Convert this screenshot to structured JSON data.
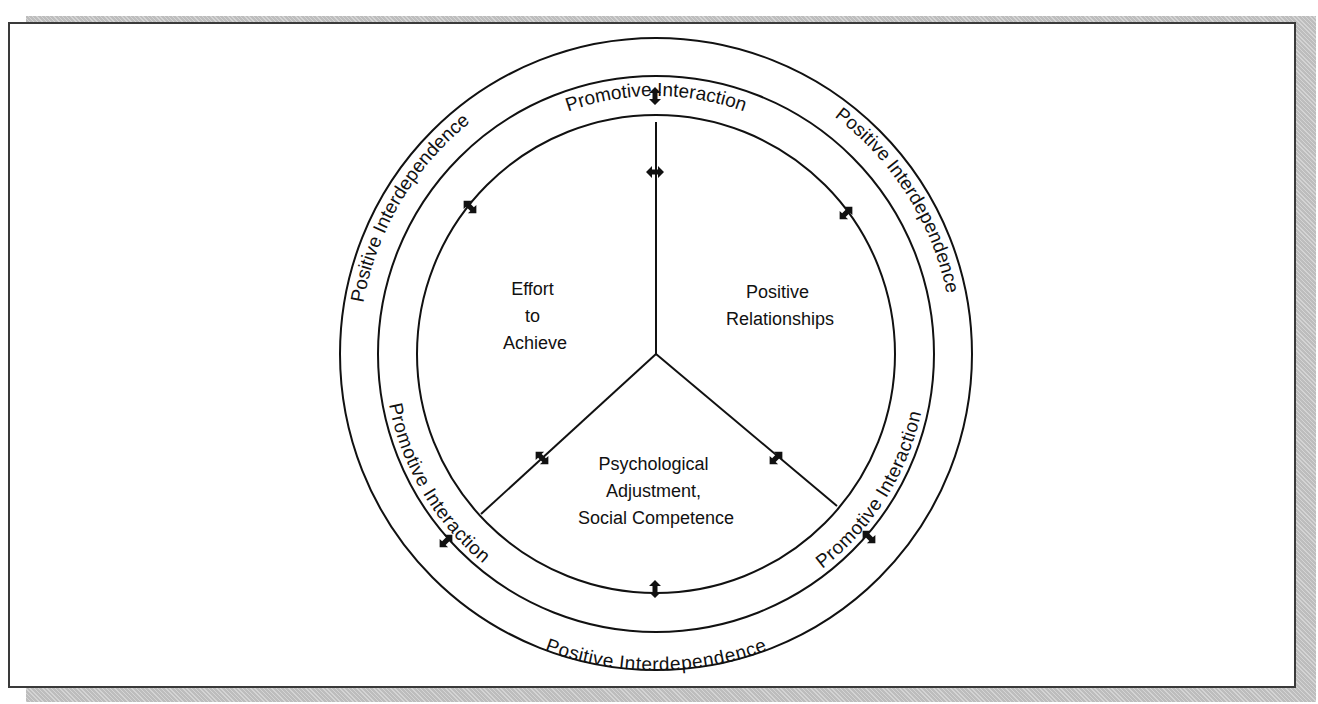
{
  "diagram": {
    "colors": {
      "stroke": "#111111",
      "background": "#ffffff",
      "shadow": "#bdbdbd",
      "frame": "#3a3a3a"
    },
    "outer_ring_labels": {
      "top_left": "Positive Interdependence",
      "top_right": "Positive Interdependence",
      "bottom": "Positive Interdependence"
    },
    "middle_ring_labels": {
      "top": "Promotive Interaction",
      "bottom_left": "Promotive Interaction",
      "bottom_right": "Promotive Interaction"
    },
    "sectors": {
      "left": {
        "line1": "Effort",
        "line2": "to",
        "line3": "Achieve"
      },
      "right": {
        "line1": "Positive",
        "line2": "Relationships"
      },
      "bottom": {
        "line1": "Psychological",
        "line2": "Adjustment,",
        "line3": "Social Competence"
      }
    },
    "arrows": {
      "icon": "double-headed-arrow-icon",
      "count": 9
    }
  }
}
